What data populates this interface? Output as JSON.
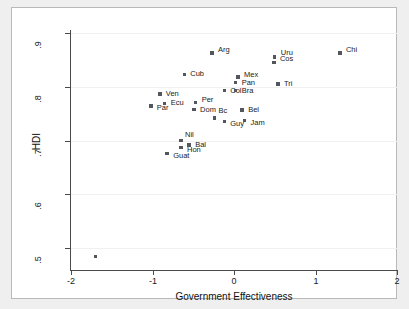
{
  "figure": {
    "background_color": "#efefef",
    "panel_color": "#ffffff",
    "marker_color": "#53565c",
    "axis_color": "#4a4a4a",
    "grid_color": "#f0f0f0"
  },
  "chart_data": {
    "type": "scatter",
    "title": "",
    "xlabel": "Government Effectiveness",
    "ylabel": "HDI",
    "xlim": [
      -2,
      2
    ],
    "ylim": [
      0.46,
      0.905
    ],
    "xticks": [
      -2,
      -1,
      0,
      1,
      2
    ],
    "xticklabels": [
      "-2",
      "-1",
      "0",
      "1",
      "2"
    ],
    "yticks": [
      0.5,
      0.6,
      0.7,
      0.8,
      0.9
    ],
    "yticklabels": [
      ".5",
      ".6",
      ".7",
      ".8",
      ".9"
    ],
    "grid": true,
    "grid_axis": "y",
    "legend": null,
    "points": [
      {
        "label": "Arg",
        "x": -0.27,
        "y": 0.862,
        "label_dx": 6,
        "label_dy": -3
      },
      {
        "label": "Chi",
        "x": 1.3,
        "y": 0.862,
        "label_dx": 6,
        "label_dy": -3
      },
      {
        "label": "Uru",
        "x": 0.5,
        "y": 0.855,
        "label_dx": 6,
        "label_dy": -4
      },
      {
        "label": "Cos",
        "x": 0.49,
        "y": 0.845,
        "label_dx": 6,
        "label_dy": -3
      },
      {
        "label": "Cub",
        "x": -0.61,
        "y": 0.823,
        "label_dx": 6,
        "label_dy": 0
      },
      {
        "label": "Mex",
        "x": 0.05,
        "y": 0.818,
        "label_dx": 6,
        "label_dy": -2
      },
      {
        "label": "Pan",
        "x": 0.02,
        "y": 0.808,
        "label_dx": 6,
        "label_dy": 1
      },
      {
        "label": "Tri",
        "x": 0.54,
        "y": 0.805,
        "label_dx": 6,
        "label_dy": 0
      },
      {
        "label": "Col",
        "x": -0.12,
        "y": 0.793,
        "label_dx": 6,
        "label_dy": 1
      },
      {
        "label": "Bra",
        "x": 0.02,
        "y": 0.793,
        "label_dx": 6,
        "label_dy": 1
      },
      {
        "label": "Ven",
        "x": -0.91,
        "y": 0.786,
        "label_dx": 6,
        "label_dy": 0
      },
      {
        "label": "Per",
        "x": -0.47,
        "y": 0.771,
        "label_dx": 6,
        "label_dy": -2
      },
      {
        "label": "Ecu",
        "x": -0.85,
        "y": 0.769,
        "label_dx": 6,
        "label_dy": 0
      },
      {
        "label": "Par",
        "x": -1.02,
        "y": 0.764,
        "label_dx": 6,
        "label_dy": 2
      },
      {
        "label": "Dom",
        "x": -0.49,
        "y": 0.758,
        "label_dx": 6,
        "label_dy": 1
      },
      {
        "label": "Bel",
        "x": 0.1,
        "y": 0.757,
        "label_dx": 6,
        "label_dy": 0
      },
      {
        "label": "Bc",
        "x": -0.24,
        "y": 0.742,
        "label_dx": 4,
        "label_dy": -7
      },
      {
        "label": "Guy",
        "x": -0.12,
        "y": 0.735,
        "label_dx": 6,
        "label_dy": 2
      },
      {
        "label": "Jam",
        "x": 0.13,
        "y": 0.737,
        "label_dx": 6,
        "label_dy": 2
      },
      {
        "label": "Nil",
        "x": -0.65,
        "y": 0.7,
        "label_dx": 4,
        "label_dy": -6
      },
      {
        "label": "Bal",
        "x": -0.55,
        "y": 0.692,
        "label_dx": 6,
        "label_dy": 0
      },
      {
        "label": "Hon",
        "x": -0.65,
        "y": 0.687,
        "label_dx": 6,
        "label_dy": 2
      },
      {
        "label": "Guat",
        "x": -0.82,
        "y": 0.676,
        "label_dx": 6,
        "label_dy": 2
      },
      {
        "label": "",
        "x": -1.7,
        "y": 0.485,
        "label_dx": 0,
        "label_dy": 0
      }
    ]
  }
}
